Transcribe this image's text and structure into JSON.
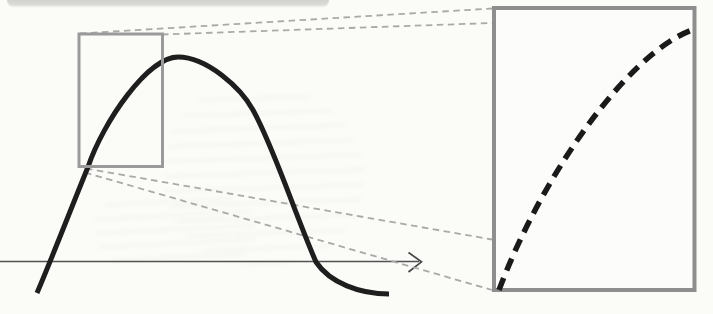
{
  "figure": {
    "width": 713,
    "height": 314,
    "background": "#fbfbf8"
  },
  "colors": {
    "curve_black": "#1e1e1e",
    "inset_curve_black": "#1a1a1a",
    "box_gray": "#9a9a9a",
    "inset_box_gray": "#8e8e8e",
    "connector_gray": "#a9a9a9",
    "axis_gray": "#515151",
    "page_band_gray": "#d7d7d4",
    "inset_fill": "#fcfcfa"
  },
  "top_band": {
    "x": 7,
    "y": 0,
    "width": 322,
    "height": 6
  },
  "layers": [
    {
      "name": "x-axis-line",
      "type": "line",
      "x1": 0,
      "y1": 261.5,
      "x2": 419,
      "y2": 261.5,
      "stroke": "#515151",
      "width": 1.7
    },
    {
      "name": "x-axis-arrowhead",
      "type": "path",
      "d": "M 408.5 252.5 L 421.5 261.8 L 408.5 272",
      "stroke": "#454545",
      "width": 1.7,
      "fill": "none",
      "linejoin": "miter",
      "linecap": "butt"
    },
    {
      "name": "zoom-connector-top-outer",
      "type": "line",
      "x1": 80,
      "y1": 33.5,
      "x2": 492,
      "y2": 8.5,
      "stroke": "#a9a9a9",
      "width": 1.8,
      "dash": "6.5 4.5"
    },
    {
      "name": "zoom-connector-top-inner",
      "type": "line",
      "x1": 162,
      "y1": 34.5,
      "x2": 492,
      "y2": 23,
      "stroke": "#a9a9a9",
      "width": 1.8,
      "dash": "6.5 4.5"
    },
    {
      "name": "zoom-connector-bottom-inner",
      "type": "line",
      "x1": 86,
      "y1": 168.5,
      "x2": 492,
      "y2": 239.5,
      "stroke": "#a9a9a9",
      "width": 1.8,
      "dash": "6.5 4.5"
    },
    {
      "name": "zoom-connector-bottom-outer",
      "type": "line",
      "x1": 85,
      "y1": 172.5,
      "x2": 492,
      "y2": 290,
      "stroke": "#a9a9a9",
      "width": 1.8,
      "dash": "6.5 4.5"
    },
    {
      "name": "main-curve",
      "type": "path",
      "d": "M 37 293 C 52 258 72 206 88 167 C 103 122 148 57 178 57 C 207 57 241 88 253 110 C 274 148 295 214 316 262 C 330 283 360 294 389 294",
      "stroke": "#1e1e1e",
      "width": 5,
      "fill": "none",
      "linecap": "butt",
      "linejoin": "round"
    },
    {
      "name": "zoom-source-rectangle",
      "type": "rect",
      "x": 79,
      "y": 34,
      "width": 83.5,
      "height": 132.5,
      "stroke": "#9a9a9a",
      "width_px": 3,
      "fill": "none"
    },
    {
      "name": "zoom-inset-rectangle",
      "type": "rect",
      "x": 494,
      "y": 8,
      "width": 200.5,
      "height": 282,
      "stroke": "#8e8e8e",
      "width_px": 4,
      "fill": "#fcfcfa"
    },
    {
      "name": "magnified-curve-dashed",
      "type": "path",
      "d": "M 499 290 C 540 180 625 55 692 30",
      "stroke": "#1a1a1a",
      "width": 5.5,
      "fill": "none",
      "dash": "13 8",
      "linecap": "butt"
    }
  ]
}
